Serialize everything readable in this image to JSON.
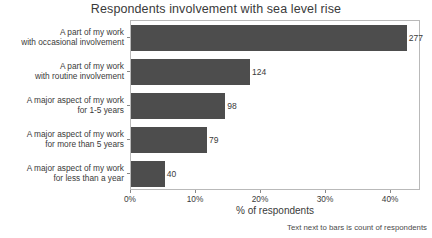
{
  "chart_data": {
    "type": "bar",
    "orientation": "horizontal",
    "title": "Respondents involvement with sea level rise",
    "xlabel": "% of respondents",
    "ylabel": "",
    "footnote": "Text next to bars is count of respondents",
    "grid": false,
    "legend": null,
    "xlim": [
      0,
      44.6
    ],
    "xticks": [
      0,
      10,
      20,
      30,
      40
    ],
    "xticklabels": [
      "0%",
      "10%",
      "20%",
      "30%",
      "40%"
    ],
    "bar_color": "#4d4d4d",
    "categories": [
      "A part of my work\nwith occasional involvement",
      "A part of my work\nwith routine involvement",
      "A major aspect of my work\nfor 1-5 years",
      "A major aspect of my work\nfor more than 5 years",
      "A major aspect of my work\nfor less than a year"
    ],
    "category_lines": [
      [
        "A part of my work",
        "with occasional involvement"
      ],
      [
        "A part of my work",
        "with routine involvement"
      ],
      [
        "A major aspect of my work",
        "for 1-5 years"
      ],
      [
        "A major aspect of my work",
        "for more than 5 years"
      ],
      [
        "A major aspect of my work",
        "for less than a year"
      ]
    ],
    "values": [
      42.4,
      18.3,
      14.5,
      11.7,
      5.2
    ],
    "counts": [
      277,
      124,
      98,
      79,
      40
    ],
    "count_labels": [
      "277",
      "124",
      "98",
      "79",
      "40"
    ],
    "bars": [
      {
        "line1": "A part of my work",
        "line2": "with occasional involvement",
        "percent": 42.4,
        "count_label": "277"
      },
      {
        "line1": "A part of my work",
        "line2": "with routine involvement",
        "percent": 18.3,
        "count_label": "124"
      },
      {
        "line1": "A major aspect of my work",
        "line2": "for 1-5 years",
        "percent": 14.5,
        "count_label": "98"
      },
      {
        "line1": "A major aspect of my work",
        "line2": "for more than 5 years",
        "percent": 11.7,
        "count_label": "79"
      },
      {
        "line1": "A major aspect of my work",
        "line2": "for less than a year",
        "percent": 5.2,
        "count_label": "40"
      }
    ]
  }
}
